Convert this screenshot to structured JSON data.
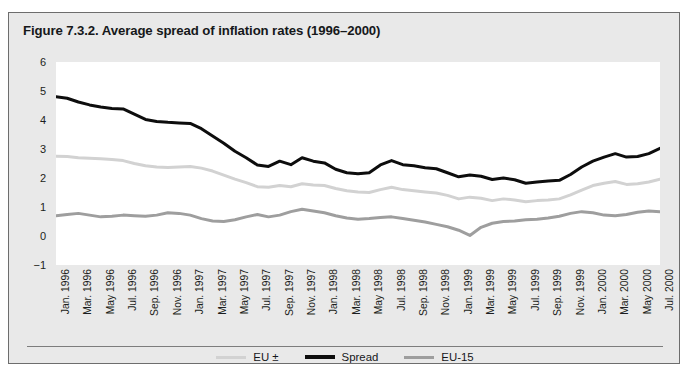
{
  "figure": {
    "title": "Figure 7.3.2. Average spread of inflation rates (1996–2000)"
  },
  "chart_data": {
    "type": "line",
    "title": "Figure 7.3.2. Average spread of inflation rates (1996–2000)",
    "xlabel": "",
    "ylabel": "",
    "ylim": [
      -1,
      6
    ],
    "yticks": [
      6,
      5,
      4,
      3,
      2,
      1,
      0,
      -1
    ],
    "grid": false,
    "legend_position": "bottom-center",
    "x_tick_interval_months": 2,
    "x": [
      "Jan. 1996",
      "Feb. 1996",
      "Mar. 1996",
      "Apr. 1996",
      "May 1996",
      "Jun. 1996",
      "Jul. 1996",
      "Aug. 1996",
      "Sep. 1996",
      "Oct. 1996",
      "Nov. 1996",
      "Dec. 1996",
      "Jan. 1997",
      "Feb. 1997",
      "Mar. 1997",
      "Apr. 1997",
      "May 1997",
      "Jun. 1997",
      "Jul. 1997",
      "Aug. 1997",
      "Sep. 1997",
      "Oct. 1997",
      "Nov. 1997",
      "Dec. 1997",
      "Jan. 1998",
      "Feb. 1998",
      "Mar. 1998",
      "Apr. 1998",
      "May 1998",
      "Jun. 1998",
      "Jul. 1998",
      "Aug. 1998",
      "Sep. 1998",
      "Oct. 1998",
      "Nov. 1998",
      "Dec. 1998",
      "Jan. 1999",
      "Feb. 1999",
      "Mar. 1999",
      "Apr. 1999",
      "May 1999",
      "Jun. 1999",
      "Jul. 1999",
      "Aug. 1999",
      "Sep. 1999",
      "Oct. 1999",
      "Nov. 1999",
      "Dec. 1999",
      "Jan. 2000",
      "Feb. 2000",
      "Mar. 2000",
      "Apr. 2000",
      "May 2000",
      "Jun. 2000",
      "Jul. 2000"
    ],
    "x_tick_labels": [
      "Jan. 1996",
      "Mar. 1996",
      "May 1996",
      "Jul. 1996",
      "Sep. 1996",
      "Nov. 1996",
      "Jan. 1997",
      "Mar. 1997",
      "May 1997",
      "Jul. 1997",
      "Sep. 1997",
      "Nov. 1997",
      "Jan. 1998",
      "Mar. 1998",
      "May 1998",
      "Jul. 1998",
      "Sep. 1998",
      "Nov. 1998",
      "Jan. 1999",
      "Mar. 1999",
      "May 1999",
      "Jul. 1999",
      "Sep. 1999",
      "Nov. 1999",
      "Jan. 2000",
      "Mar. 2000",
      "May 2000",
      "Jul. 2000"
    ],
    "series": [
      {
        "name": "Spread",
        "color": "#0d0d0d",
        "width": 3.0,
        "values": [
          4.8,
          4.75,
          4.62,
          4.52,
          4.45,
          4.4,
          4.38,
          4.2,
          4.02,
          3.95,
          3.92,
          3.9,
          3.88,
          3.7,
          3.45,
          3.2,
          2.92,
          2.7,
          2.45,
          2.4,
          2.58,
          2.46,
          2.7,
          2.58,
          2.52,
          2.3,
          2.18,
          2.15,
          2.18,
          2.45,
          2.6,
          2.46,
          2.42,
          2.35,
          2.32,
          2.18,
          2.04,
          2.1,
          2.06,
          1.95,
          2.0,
          1.94,
          1.82,
          1.86,
          1.9,
          1.92,
          2.12,
          2.38,
          2.58,
          2.72,
          2.84,
          2.72,
          2.74,
          2.84,
          3.02
        ]
      },
      {
        "name": "EU ±",
        "color": "#d2d2d2",
        "width": 3.0,
        "values": [
          2.75,
          2.74,
          2.7,
          2.68,
          2.66,
          2.64,
          2.6,
          2.5,
          2.42,
          2.38,
          2.36,
          2.38,
          2.4,
          2.34,
          2.24,
          2.1,
          1.96,
          1.84,
          1.7,
          1.68,
          1.74,
          1.7,
          1.8,
          1.76,
          1.74,
          1.64,
          1.56,
          1.52,
          1.5,
          1.6,
          1.68,
          1.6,
          1.56,
          1.52,
          1.48,
          1.4,
          1.28,
          1.34,
          1.3,
          1.22,
          1.28,
          1.24,
          1.18,
          1.22,
          1.24,
          1.28,
          1.42,
          1.58,
          1.74,
          1.82,
          1.88,
          1.78,
          1.8,
          1.86,
          1.96
        ]
      },
      {
        "name": "EU-15",
        "color": "#9e9e9e",
        "width": 3.0,
        "values": [
          0.7,
          0.74,
          0.78,
          0.72,
          0.66,
          0.68,
          0.72,
          0.7,
          0.68,
          0.72,
          0.8,
          0.78,
          0.72,
          0.6,
          0.52,
          0.5,
          0.56,
          0.66,
          0.74,
          0.66,
          0.72,
          0.84,
          0.92,
          0.86,
          0.8,
          0.7,
          0.62,
          0.58,
          0.6,
          0.64,
          0.66,
          0.6,
          0.54,
          0.48,
          0.4,
          0.32,
          0.2,
          0.02,
          0.3,
          0.44,
          0.5,
          0.52,
          0.56,
          0.58,
          0.62,
          0.68,
          0.78,
          0.84,
          0.8,
          0.72,
          0.7,
          0.74,
          0.82,
          0.86,
          0.84
        ]
      }
    ]
  },
  "legend": {
    "items": [
      {
        "label": "EU ±",
        "color": "#d2d2d2",
        "thickness": 3
      },
      {
        "label": "Spread",
        "color": "#0d0d0d",
        "thickness": 4
      },
      {
        "label": "EU-15",
        "color": "#9e9e9e",
        "thickness": 3
      }
    ]
  }
}
